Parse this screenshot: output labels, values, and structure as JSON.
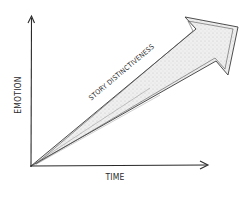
{
  "diagram": {
    "type": "hand-drawn conceptual axes diagram",
    "x_axis_label": "TIME",
    "y_axis_label": "EMOTION",
    "arrow_label": "STORY DISTINCTIVENESS",
    "colors": {
      "ink": "#2a2a2a",
      "arrow_fill": "#e6e6e6",
      "background": "#ffffff"
    }
  }
}
